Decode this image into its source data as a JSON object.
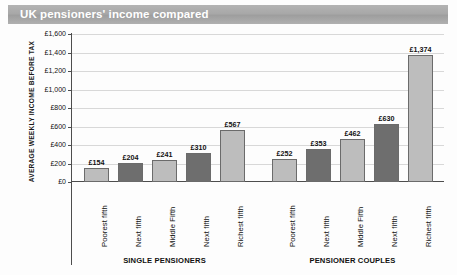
{
  "header": {
    "title": "UK pensioners' income compared"
  },
  "chart_data": {
    "type": "bar",
    "title": "UK pensioners' income compared",
    "xlabel": "",
    "ylabel": "AVERAGE WEEKLY INCOME BEFORE TAX",
    "ylim": [
      0,
      1600
    ],
    "grid": true,
    "legend": "none",
    "ytick_labels": [
      "£1,600",
      "£1,400",
      "£1,200",
      "£1,000",
      "£800",
      "£600",
      "£400",
      "£200",
      "£0"
    ],
    "ytick_values": [
      1600,
      1400,
      1200,
      1000,
      800,
      600,
      400,
      200,
      0
    ],
    "groups": [
      {
        "name": "SINGLE PENSIONERS",
        "categories": [
          "Poorest fifth",
          "Next fifth",
          "Middle Fifth",
          "Next fifth",
          "Richest fifth"
        ],
        "values": [
          154,
          204,
          241,
          310,
          567
        ],
        "labels": [
          "£154",
          "£204",
          "£241",
          "£310",
          "£567"
        ],
        "shades": [
          "light",
          "dark",
          "light",
          "dark",
          "light"
        ]
      },
      {
        "name": "PENSIONER COUPLES",
        "categories": [
          "Poorest fifth",
          "Next fifth",
          "Middle Fifth",
          "Next fifth",
          "Richest fifth"
        ],
        "values": [
          252,
          353,
          462,
          630,
          1374
        ],
        "labels": [
          "£252",
          "£353",
          "£462",
          "£630",
          "£1,374"
        ],
        "shades": [
          "light",
          "dark",
          "light",
          "dark",
          "light"
        ]
      }
    ],
    "colors": {
      "bar_light": "#bdbdbd",
      "bar_dark": "#6e6e6e",
      "bar_edge": "#6b6b6b",
      "grid": "#d8d8d8",
      "axis": "#4d4d4d",
      "banner": "#a8a8a8",
      "banner_text": "#ffffff"
    }
  }
}
